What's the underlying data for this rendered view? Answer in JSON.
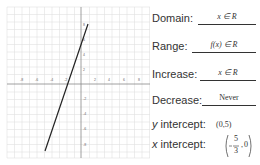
{
  "graph": {
    "x_ticks": [
      "-8",
      "-6",
      "-4",
      "-2",
      "2",
      "4",
      "6",
      "8"
    ],
    "y_ticks_pos": [
      "8",
      "6",
      "4",
      "2"
    ],
    "y_ticks_neg": [
      "-2",
      "-4",
      "-6",
      "-8"
    ],
    "line_color": "#222222",
    "grid_color": "#dddddd"
  },
  "properties": {
    "domain_label": "Domain:",
    "domain_value": "x ∈ R",
    "range_label": "Range:",
    "range_value": "f(x) ∈ R",
    "increase_label": "Increase:",
    "increase_value": "x ∈ R",
    "decrease_label": "Decrease:",
    "decrease_value": "Never",
    "y_intercept_label_var": "y",
    "y_intercept_label": " intercept:",
    "y_intercept_value": "(0,5)",
    "x_intercept_label_var": "x",
    "x_intercept_label": " intercept:",
    "x_intercept_num": "5",
    "x_intercept_den": "3",
    "x_intercept_y": "0"
  }
}
